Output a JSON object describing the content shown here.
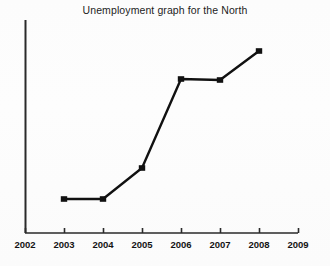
{
  "chart_data": {
    "type": "line",
    "title": "Unemployment graph for the North",
    "xlabel": "",
    "ylabel": "",
    "x_tick_labels": [
      "2002",
      "2003",
      "2004",
      "2005",
      "2006",
      "2007",
      "2008",
      "2009"
    ],
    "y_tick_labels": [],
    "grid": false,
    "legend": null,
    "xlim": [
      2002,
      2009
    ],
    "ylim": [
      0,
      100
    ],
    "marker": "square",
    "marker_color": "#111111",
    "line_color": "#111111",
    "axis_color": "#2a2a2a",
    "background_color": "#fdfdfd",
    "series": [
      {
        "name": "Unemployment",
        "x": [
          "2003",
          "2004",
          "2005",
          "2006",
          "2007",
          "2008"
        ],
        "values": [
          16,
          16,
          31,
          73,
          72,
          86
        ],
        "pixel_points": [
          {
            "x": 64,
            "y": 199
          },
          {
            "x": 103,
            "y": 199
          },
          {
            "x": 142,
            "y": 168
          },
          {
            "x": 181,
            "y": 79
          },
          {
            "x": 220,
            "y": 80
          },
          {
            "x": 259,
            "y": 51
          }
        ]
      }
    ],
    "axes_geometry": {
      "x_axis_y": 233,
      "y_axis_x": 25.5,
      "y_axis_top": 20,
      "plot_left": 25,
      "plot_right": 298,
      "tick_x_positions": [
        25,
        64,
        103,
        142,
        181,
        220,
        259,
        298
      ],
      "tick_length": 5
    },
    "annotations": []
  },
  "page": {
    "title": "Unemployment graph for the North"
  }
}
